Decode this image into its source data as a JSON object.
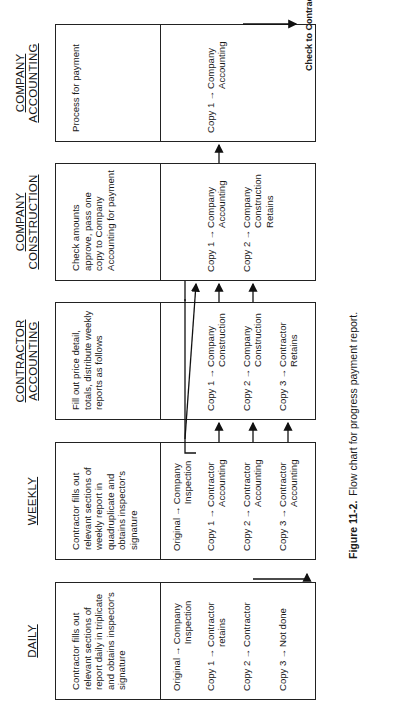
{
  "figure": {
    "number": "Figure 11-2.",
    "caption": "Flow chart for progress payment report.",
    "orientation": "rotated 90° counter-clockwise"
  },
  "columns": [
    {
      "id": "daily",
      "header": "DAILY",
      "description": "Contractor fills out relevant sections of report daily in triplicate and obtains inspector's signature",
      "copies": [
        {
          "label": "Original",
          "destination": "Company Inspection"
        },
        {
          "label": "Copy 1",
          "destination": "Contractor retains"
        },
        {
          "label": "Copy 2",
          "destination": "Contractor"
        },
        {
          "label": "Copy 3",
          "destination": "Not done"
        }
      ]
    },
    {
      "id": "weekly",
      "header": "WEEKLY",
      "description": "Contractor fills out relevant sections of weekly report in quadruplicate and obtains inspector's signature",
      "copies": [
        {
          "label": "Original",
          "destination": "Company Inspection"
        },
        {
          "label": "Copy 1",
          "destination": "Contractor Accounting"
        },
        {
          "label": "Copy 2",
          "destination": "Contractor Accounting"
        },
        {
          "label": "Copy 3",
          "destination": "Contractor Accounting"
        }
      ]
    },
    {
      "id": "contractor-accounting",
      "header_line1": "CONTRACTOR",
      "header_line2": "ACCOUNTING",
      "description": "Fill out price detail, totals, distribute weekly reports as follows",
      "copies": [
        {
          "label": "Copy 1",
          "destination": "Company Construction"
        },
        {
          "label": "Copy 2",
          "destination": "Company Construction"
        },
        {
          "label": "Copy 3",
          "destination": "Contractor Retains"
        }
      ]
    },
    {
      "id": "company-construction",
      "header_line1": "COMPANY",
      "header_line2": "CONSTRUCTION",
      "description": "Check amounts approve, pass one copy to Company Accounting for payment",
      "copies": [
        {
          "label": "Copy 1",
          "destination": "Company Accounting"
        },
        {
          "label": "Copy 2",
          "destination": "Company Construction Retains"
        }
      ]
    },
    {
      "id": "company-accounting",
      "header_line1": "COMPANY",
      "header_line2": "ACCOUNTING",
      "description": "Process for payment",
      "copies": [
        {
          "label": "Copy 1",
          "destination": "Company Accounting"
        }
      ]
    }
  ],
  "output": {
    "label": "Check to Contractor"
  },
  "arrow_glyph": "→"
}
